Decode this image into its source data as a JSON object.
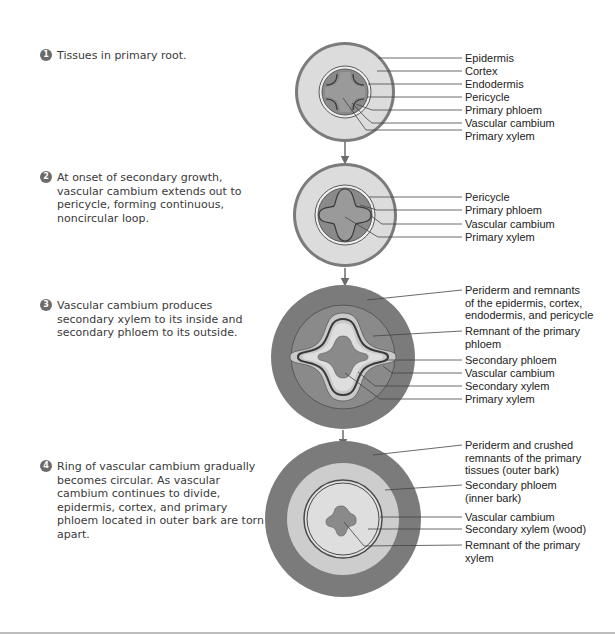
{
  "colors": {
    "periderm": "#7b7b7b",
    "cortex": "#d9d9d9",
    "vascular_dark": "#8a8a8a",
    "phloem_light": "#c8c8c8",
    "outline": "#5a5a5a",
    "arrow": "#6b6b6b"
  },
  "steps": [
    {
      "number": "1",
      "text": "Tissues in primary root."
    },
    {
      "number": "2",
      "text": "At onset of secondary growth, vascular cambium extends out to pericycle, forming continuous, noncircular loop."
    },
    {
      "number": "3",
      "text": "Vascular cambium produces secondary xylem to its inside and secondary phloem to its outside."
    },
    {
      "number": "4",
      "text": "Ring of vascular cambium gradually becomes circular. As vascular cambium continues to divide, epidermis, cortex, and primary phloem located in outer bark are torn apart."
    }
  ],
  "diagram1_labels": [
    "Epidermis",
    "Cortex",
    "Endodermis",
    "Pericycle",
    "Primary phloem",
    "Vascular cambium",
    "Primary xylem"
  ],
  "diagram2_labels": [
    "Pericycle",
    "Primary phloem",
    "Vascular cambium",
    "Primary xylem"
  ],
  "diagram3_labels": [
    "Periderm and remnants\nof the epidermis, cortex,\nendodermis, and pericycle",
    "Remnant of the primary\nphloem",
    "Secondary phloem",
    "Vascular cambium",
    "Secondary xylem",
    "Primary xylem"
  ],
  "diagram4_labels": [
    "Periderm and crushed\nremnants of the primary\ntissues (outer bark)",
    "Secondary phloem\n(inner bark)",
    "Vascular cambium",
    "Secondary xylem (wood)",
    "Remnant of the primary\nxylem"
  ]
}
